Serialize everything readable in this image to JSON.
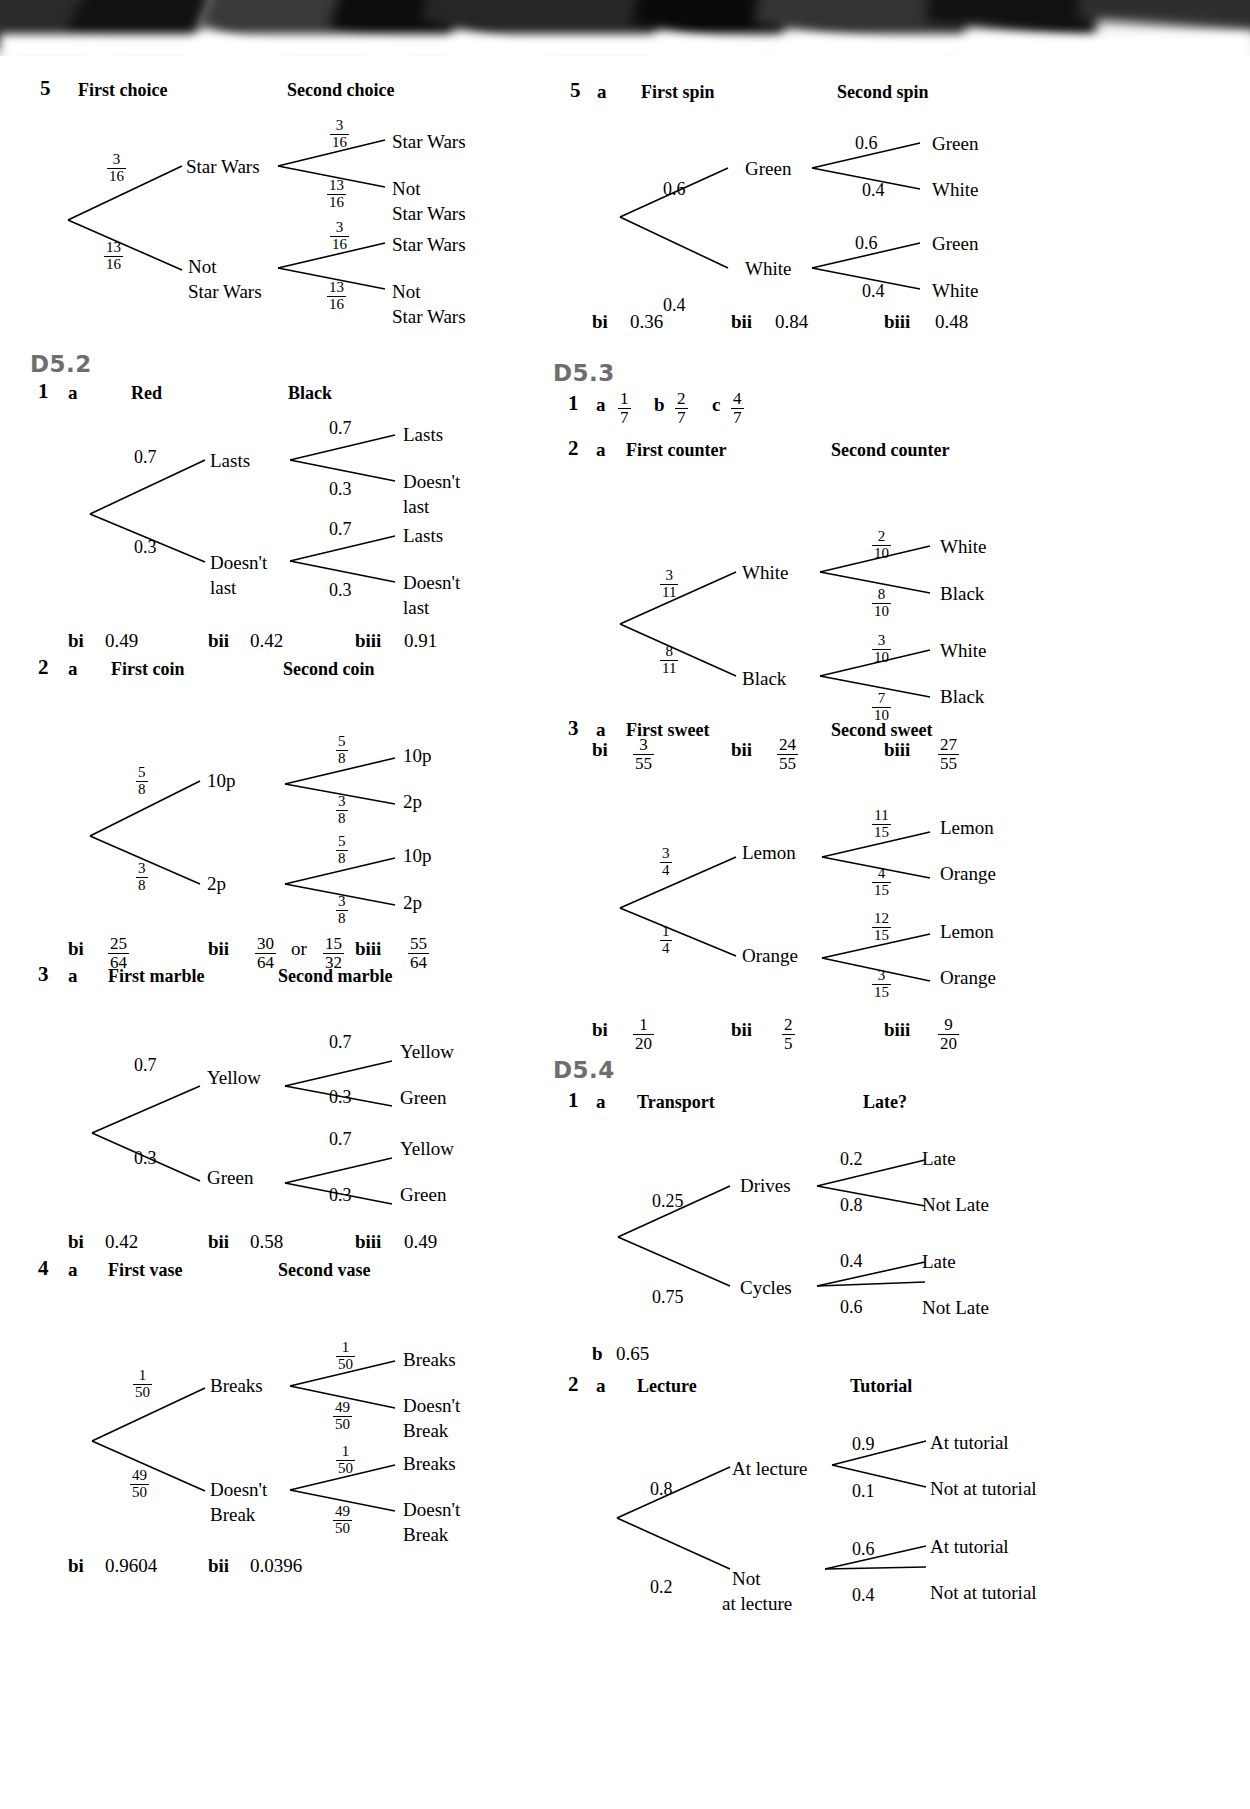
{
  "page": {
    "sections": [
      {
        "id": "top-left",
        "label": ""
      },
      {
        "id": "D5.2",
        "label": "D5.2"
      },
      {
        "id": "D5.3",
        "label": "D5.3"
      },
      {
        "id": "D5.4",
        "label": "D5.4"
      }
    ]
  },
  "left": {
    "q5": {
      "num": "5",
      "col1": "First choice",
      "col2": "Second choice",
      "p_top": {
        "n": "3",
        "d": "16"
      },
      "p_bot": {
        "n": "13",
        "d": "16"
      },
      "node_top": "Star Wars",
      "node_bot_l1": "Not",
      "node_bot_l2": "Star Wars",
      "p_tt": {
        "n": "3",
        "d": "16"
      },
      "p_tb": {
        "n": "13",
        "d": "16"
      },
      "p_bt": {
        "n": "3",
        "d": "16"
      },
      "p_bb": {
        "n": "13",
        "d": "16"
      },
      "leaf1": "Star Wars",
      "leaf2_l1": "Not",
      "leaf2_l2": "Star Wars",
      "leaf3": "Star Wars",
      "leaf4_l1": "Not",
      "leaf4_l2": "Star Wars"
    },
    "d52": {
      "label": "D5.2",
      "q1": {
        "num": "1",
        "part": "a",
        "col1": "Red",
        "col2": "Black",
        "p_top": "0.7",
        "p_bot": "0.3",
        "node_top": "Lasts",
        "node_bot_l1": "Doesn't",
        "node_bot_l2": "last",
        "p_tt": "0.7",
        "p_tb": "0.3",
        "p_bt": "0.7",
        "p_bb": "0.3",
        "leaf1": "Lasts",
        "leaf2_l1": "Doesn't",
        "leaf2_l2": "last",
        "leaf3": "Lasts",
        "leaf4_l1": "Doesn't",
        "leaf4_l2": "last",
        "ans": [
          {
            "label": "bi",
            "value": "0.49"
          },
          {
            "label": "bii",
            "value": "0.42"
          },
          {
            "label": "biii",
            "value": "0.91"
          }
        ]
      },
      "q2": {
        "num": "2",
        "part": "a",
        "col1": "First coin",
        "col2": "Second coin",
        "p_top": {
          "n": "5",
          "d": "8"
        },
        "p_bot": {
          "n": "3",
          "d": "8"
        },
        "node_top": "10p",
        "node_bot": "2p",
        "p_tt": {
          "n": "5",
          "d": "8"
        },
        "p_tb": {
          "n": "3",
          "d": "8"
        },
        "p_bt": {
          "n": "5",
          "d": "8"
        },
        "p_bb": {
          "n": "3",
          "d": "8"
        },
        "leaf1": "10p",
        "leaf2": "2p",
        "leaf3": "10p",
        "leaf4": "2p",
        "ans": [
          {
            "label": "bi",
            "frac": {
              "n": "25",
              "d": "64"
            }
          },
          {
            "label": "bii",
            "frac": {
              "n": "30",
              "d": "64"
            },
            "or": "or",
            "frac2": {
              "n": "15",
              "d": "32"
            }
          },
          {
            "label": "biii",
            "frac": {
              "n": "55",
              "d": "64"
            }
          }
        ]
      },
      "q3": {
        "num": "3",
        "part": "a",
        "col1": "First marble",
        "col2": "Second marble",
        "p_top": "0.7",
        "p_bot": "0.3",
        "node_top": "Yellow",
        "node_bot": "Green",
        "p_tt": "0.7",
        "p_tb": "0.3",
        "p_bt": "0.7",
        "p_bb": "0.3",
        "leaf1": "Yellow",
        "leaf2": "Green",
        "leaf3": "Yellow",
        "leaf4": "Green",
        "ans": [
          {
            "label": "bi",
            "value": "0.42"
          },
          {
            "label": "bii",
            "value": "0.58"
          },
          {
            "label": "biii",
            "value": "0.49"
          }
        ]
      },
      "q4": {
        "num": "4",
        "part": "a",
        "col1": "First vase",
        "col2": "Second vase",
        "p_top": {
          "n": "1",
          "d": "50"
        },
        "p_bot": {
          "n": "49",
          "d": "50"
        },
        "node_top": "Breaks",
        "node_bot_l1": "Doesn't",
        "node_bot_l2": "Break",
        "p_tt": {
          "n": "1",
          "d": "50"
        },
        "p_tb": {
          "n": "49",
          "d": "50"
        },
        "p_bt": {
          "n": "1",
          "d": "50"
        },
        "p_bb": {
          "n": "49",
          "d": "50"
        },
        "leaf1": "Breaks",
        "leaf2_l1": "Doesn't",
        "leaf2_l2": "Break",
        "leaf3": "Breaks",
        "leaf4_l1": "Doesn't",
        "leaf4_l2": "Break",
        "ans": [
          {
            "label": "bi",
            "value": "0.9604"
          },
          {
            "label": "bii",
            "value": "0.0396"
          }
        ]
      }
    }
  },
  "right": {
    "q5": {
      "num": "5",
      "part": "a",
      "col1": "First spin",
      "col2": "Second spin",
      "p_top": "0.6",
      "p_bot": "0.4",
      "node_top": "Green",
      "node_bot": "White",
      "p_tt": "0.6",
      "p_tb": "0.4",
      "p_bt": "0.6",
      "p_bb": "0.4",
      "leaf1": "Green",
      "leaf2": "White",
      "leaf3": "Green",
      "leaf4": "White",
      "ans": [
        {
          "label": "bi",
          "value": "0.36"
        },
        {
          "label": "bii",
          "value": "0.84"
        },
        {
          "label": "biii",
          "value": "0.48"
        }
      ]
    },
    "d53": {
      "label": "D5.3",
      "q1": {
        "num": "1",
        "parts": [
          {
            "letter": "a",
            "frac": {
              "n": "1",
              "d": "7"
            }
          },
          {
            "letter": "b",
            "frac": {
              "n": "2",
              "d": "7"
            }
          },
          {
            "letter": "c",
            "frac": {
              "n": "4",
              "d": "7"
            }
          }
        ]
      },
      "q2": {
        "num": "2",
        "part": "a",
        "col1": "First counter",
        "col2": "Second counter",
        "p_top": {
          "n": "3",
          "d": "11"
        },
        "p_bot": {
          "n": "8",
          "d": "11"
        },
        "node_top": "White",
        "node_bot": "Black",
        "p_tt": {
          "n": "2",
          "d": "10"
        },
        "p_tb": {
          "n": "8",
          "d": "10"
        },
        "p_bt": {
          "n": "3",
          "d": "10"
        },
        "p_bb": {
          "n": "7",
          "d": "10"
        },
        "leaf1": "White",
        "leaf2": "Black",
        "leaf3": "White",
        "leaf4": "Black",
        "ans": [
          {
            "label": "bi",
            "frac": {
              "n": "3",
              "d": "55"
            }
          },
          {
            "label": "bii",
            "frac": {
              "n": "24",
              "d": "55"
            }
          },
          {
            "label": "biii",
            "frac": {
              "n": "27",
              "d": "55"
            }
          }
        ]
      },
      "q3": {
        "num": "3",
        "part": "a",
        "col1": "First sweet",
        "col2": "Second sweet",
        "p_top": {
          "n": "3",
          "d": "4"
        },
        "p_bot": {
          "n": "1",
          "d": "4"
        },
        "node_top": "Lemon",
        "node_bot": "Orange",
        "p_tt": {
          "n": "11",
          "d": "15"
        },
        "p_tb": {
          "n": "4",
          "d": "15"
        },
        "p_bt": {
          "n": "12",
          "d": "15"
        },
        "p_bb": {
          "n": "3",
          "d": "15"
        },
        "leaf1": "Lemon",
        "leaf2": "Orange",
        "leaf3": "Lemon",
        "leaf4": "Orange",
        "ans": [
          {
            "label": "bi",
            "frac": {
              "n": "1",
              "d": "20"
            }
          },
          {
            "label": "bii",
            "frac": {
              "n": "2",
              "d": "5"
            }
          },
          {
            "label": "biii",
            "frac": {
              "n": "9",
              "d": "20"
            }
          }
        ]
      }
    },
    "d54": {
      "label": "D5.4",
      "q1": {
        "num": "1",
        "part": "a",
        "col1": "Transport",
        "col2": "Late?",
        "p_top": "0.25",
        "p_bot": "0.75",
        "node_top": "Drives",
        "node_bot": "Cycles",
        "p_tt": "0.2",
        "p_tb": "0.8",
        "p_bt": "0.4",
        "p_bb": "0.6",
        "leaf1": "Late",
        "leaf2": "Not Late",
        "leaf3": "Late",
        "leaf4": "Not Late",
        "b_label": "b",
        "b_value": "0.65"
      },
      "q2": {
        "num": "2",
        "part": "a",
        "col1": "Lecture",
        "col2": "Tutorial",
        "p_top": "0.8",
        "p_bot": "0.2",
        "node_top": "At lecture",
        "node_bot_l1": "Not",
        "node_bot_l2": "at lecture",
        "p_tt": "0.9",
        "p_tb": "0.1",
        "p_bt": "0.6",
        "p_bb": "0.4",
        "leaf1": "At tutorial",
        "leaf2": "Not at tutorial",
        "leaf3": "At tutorial",
        "leaf4": "Not at tutorial"
      }
    }
  }
}
